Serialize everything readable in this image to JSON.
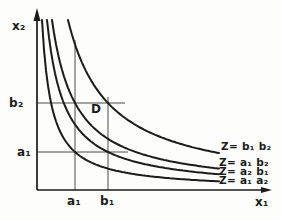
{
  "figure": {
    "width": 281,
    "height": 220,
    "background": "#fdfdfc",
    "ink": "#1b1b1b",
    "ref_color": "#4a4a4a"
  },
  "chart_data": {
    "type": "line",
    "title": "",
    "xlabel": "x₁",
    "ylabel": "x₂",
    "grid": false,
    "legend_position": "labels-at-right-curve-ends",
    "x_ticks": [
      "a₁",
      "b₁"
    ],
    "y_ticks": [
      "b₂",
      "a₁"
    ],
    "marked_point": {
      "label": "D",
      "x": 108,
      "y": 103,
      "meaning": "intersection of b₁ vertical and b₂ horizontal guides"
    },
    "axes_px": {
      "origin_x": 37,
      "origin_y": 190,
      "x_end": 272,
      "y_end": 8,
      "curve_top_y": 20,
      "curve_right_x": 219
    },
    "series": [
      {
        "name": "Z= b₁ b₂",
        "C": 7123,
        "s": 10.9
      },
      {
        "name": "Z= a₁ b₂",
        "C": 4099,
        "s": 9.1
      },
      {
        "name": "Z= a₂ b₁",
        "C": 2986,
        "s": 7.6
      },
      {
        "name": "Z= a₁ a₂",
        "C": 1615,
        "s": 4.5
      }
    ],
    "reference_lines": [
      {
        "name": "b2-horizontal",
        "x1": 37,
        "y1": 103,
        "x2": 125,
        "y2": 103
      },
      {
        "name": "a-horizontal",
        "x1": 37,
        "y1": 152,
        "x2": 128,
        "y2": 152
      },
      {
        "name": "a1-vertical",
        "x1": 75,
        "y1": 40,
        "x2": 75,
        "y2": 190
      },
      {
        "name": "b1-vertical",
        "x1": 108,
        "y1": 97,
        "x2": 108,
        "y2": 190
      }
    ]
  }
}
